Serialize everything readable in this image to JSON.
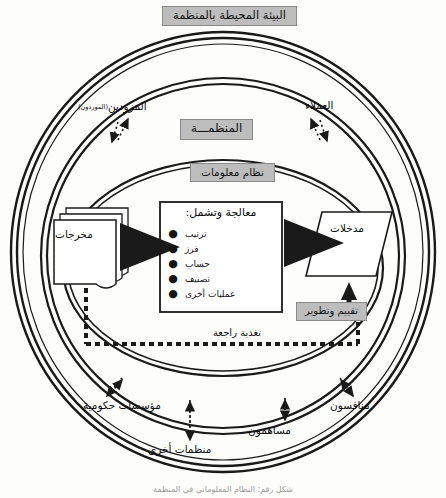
{
  "diagram": {
    "environment_title": "البيئة المحيطة بالمنظمة",
    "organization_title": "المنظمـــة",
    "information_system_title": "نظام معلومات",
    "evaluation_title": "تقييم وتطوير",
    "feedback_label": "تغذية راجعة",
    "inputs_label": "مدخلات",
    "outputs_label": "مخرجات",
    "processing": {
      "heading": "معالجة وتشمل:",
      "items": [
        "ترتيب",
        "فرز",
        "حساب",
        "تصنيف",
        "عمليات أخرى"
      ],
      "bullet_glyph": "●"
    },
    "external_actors": {
      "suppliers": "المزودين",
      "suppliers_sub": "(الموردون)",
      "customers": "العملاء",
      "government": "مؤسسات حكومية",
      "other_organizations": "منظمات أخرى",
      "shareholders": "مساهمون",
      "competitors": "منافسون"
    },
    "caption": "شكل رقم: النظام المعلوماتي في المنظمة",
    "colors": {
      "shaded_fill": "#bdbdbd",
      "shaded_border": "#8a8a8a",
      "line": "#1a1a1a",
      "background": "#fdfdfc"
    }
  }
}
